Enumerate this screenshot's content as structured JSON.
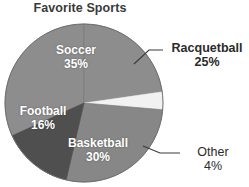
{
  "chart_data": {
    "type": "pie",
    "title": "Favorite Sports",
    "xlabel": "",
    "ylabel": "",
    "legend": "none",
    "grid": false,
    "categories": [
      "Soccer",
      "Racquetball",
      "Other",
      "Basketball",
      "Football"
    ],
    "values": [
      35,
      25,
      4,
      30,
      16
    ],
    "unit": "%",
    "slices": [
      {
        "name": "Soccer",
        "label": "Soccer",
        "value": 35,
        "percent_text": "35%",
        "color": "#8d8d8d",
        "label_placement": "inside",
        "label_color": "#ffffff"
      },
      {
        "name": "Racquetball",
        "label": "Racquetball",
        "value": 25,
        "percent_text": "25%",
        "color": "#8d8d8d",
        "label_placement": "outside",
        "label_color": "#2b2b2b"
      },
      {
        "name": "Other",
        "label": "Other",
        "value": 4,
        "percent_text": "4%",
        "color": "#f2f2f2",
        "label_placement": "outside",
        "label_color": "#2b2b2b"
      },
      {
        "name": "Basketball",
        "label": "Basketball",
        "value": 30,
        "percent_text": "30%",
        "color": "#878787",
        "label_placement": "inside",
        "label_color": "#ffffff"
      },
      {
        "name": "Football",
        "label": "Football",
        "value": 16,
        "percent_text": "16%",
        "color": "#4f4f4f",
        "label_placement": "inside",
        "label_color": "#ffffff"
      }
    ],
    "background_color": "#ffffff",
    "title_color": "#3a3a3a"
  }
}
